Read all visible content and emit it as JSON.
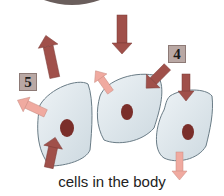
{
  "diagram": {
    "caption": "cells in the body",
    "labels": [
      {
        "id": "label-4",
        "text": "4"
      },
      {
        "id": "label-5",
        "text": "5"
      }
    ],
    "colors": {
      "cell_fill": "#dde6ec",
      "cell_stroke": "#6a7c86",
      "nucleus": "#7a2e2a",
      "dark_arrow": "#a0504a",
      "light_arrow": "#f0aaa0",
      "top_shape": "#5a5050"
    }
  }
}
